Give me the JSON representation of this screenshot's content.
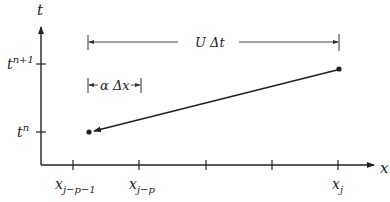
{
  "diagram": {
    "axes": {
      "y_label": "t",
      "x_label": "x"
    },
    "y_ticks": [
      {
        "label_base": "t",
        "label_sup": "n+1",
        "y": 64
      },
      {
        "label_base": "t",
        "label_sup": "n",
        "y": 132
      }
    ],
    "x_ticks": [
      {
        "label_base": "x",
        "label_sub": "j−p−1",
        "x": 73
      },
      {
        "label_base": "x",
        "label_sub": "j−p",
        "x": 139
      },
      {
        "label_base": "",
        "label_sub": "",
        "x": 206
      },
      {
        "label_base": "",
        "label_sub": "",
        "x": 272
      },
      {
        "label_base": "x",
        "label_sub": "j",
        "x": 338
      }
    ],
    "brackets": {
      "upper": {
        "text": "U Δt"
      },
      "lower": {
        "text": "α Δx"
      }
    },
    "characteristic": {
      "from_point": "(x_j, t^{n+1})",
      "to_point": "departure point at t^n"
    },
    "colors": {
      "ink": "#222222",
      "background": "#ffffff"
    }
  }
}
